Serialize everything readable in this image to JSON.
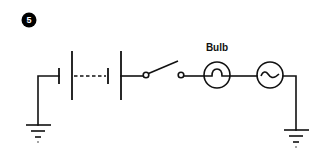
{
  "figure": {
    "number": "5",
    "badge_color": "#000000",
    "badge_text_color": "#ffffff",
    "line_color": "#111111"
  },
  "components": {
    "battery": {
      "type": "battery-multi-cell",
      "cells_shown": 2,
      "continuation": "dashed"
    },
    "switch": {
      "type": "switch",
      "state": "open"
    },
    "bulb": {
      "type": "lamp",
      "label": "Bulb"
    },
    "ac_source": {
      "type": "ac-source",
      "symbol": "~"
    },
    "ground_left": {
      "type": "ground"
    },
    "ground_right": {
      "type": "ground"
    }
  }
}
